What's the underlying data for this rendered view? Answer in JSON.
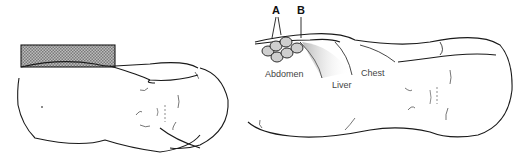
{
  "figure": {
    "left_panel": {
      "description": "Infant lying supine with block under torso"
    },
    "right_panel": {
      "labels": {
        "a": "A",
        "b": "B",
        "abdomen": "Abdomen",
        "liver": "Liver",
        "chest": "Chest"
      }
    },
    "colors": {
      "line": "#1a1a1a",
      "block_fill": "#9a9a9a",
      "label": "#444444"
    }
  }
}
